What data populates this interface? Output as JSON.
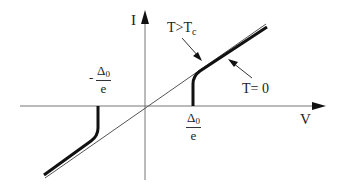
{
  "diagram": {
    "type": "I-V characteristic (superconducting tunnel junction)",
    "axes": {
      "x_label": "V",
      "y_label": "I"
    },
    "annotations": {
      "normal_state": {
        "text_main": "T>T",
        "text_sub": "c"
      },
      "zero_temperature": {
        "text": "T= 0"
      },
      "gap_positive": {
        "numerator_main": "Δ",
        "numerator_sub": "0",
        "denominator": "e"
      },
      "gap_negative": {
        "sign": "-",
        "numerator_main": "Δ",
        "numerator_sub": "0",
        "denominator": "e"
      }
    },
    "colors": {
      "axis": "#777777",
      "thin_line": "#555555",
      "thick_curve": "#111111",
      "text": "#222222"
    }
  }
}
